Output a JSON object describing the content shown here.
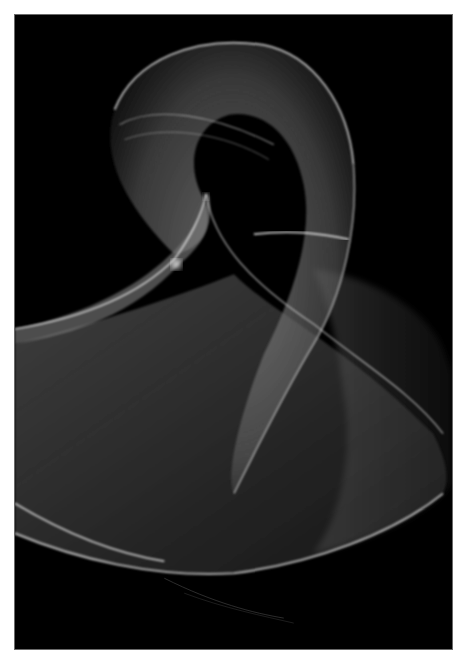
{
  "image": {
    "subject": "long-exposure light sculpture of flowing curved translucent ribbons on black background",
    "colors": {
      "background": "#000000",
      "ribbon": "#bfbfbf",
      "highlight": "#f0f0f0",
      "page": "#ffffff",
      "frame_border": "#6a6a6a"
    }
  },
  "caption": {
    "text": ""
  }
}
